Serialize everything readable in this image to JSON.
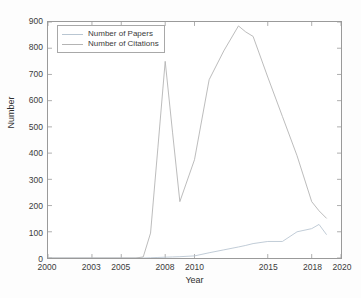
{
  "chart_data": {
    "type": "line",
    "title": "",
    "xlabel": "Year",
    "ylabel": "Number",
    "xlim": [
      2000,
      2020
    ],
    "ylim": [
      0,
      900
    ],
    "xticks": [
      2000,
      2003,
      2005,
      2008,
      2010,
      2015,
      2018,
      2020
    ],
    "xtick_labels": [
      "2000",
      "2003",
      "2005",
      "2008",
      "2010",
      "2015",
      "2018",
      "2020"
    ],
    "yticks": [
      0,
      100,
      200,
      300,
      400,
      500,
      600,
      700,
      800,
      900
    ],
    "ytick_labels": [
      "0",
      "100",
      "200",
      "300",
      "400",
      "500",
      "600",
      "700",
      "800",
      "900"
    ],
    "grid": false,
    "legend_position": "upper left",
    "x": [
      2000,
      2003,
      2005,
      2006,
      2006.5,
      2007,
      2007.5,
      2008,
      2008.5,
      2009,
      2010,
      2011,
      2012,
      2013,
      2013.5,
      2014,
      2015,
      2016,
      2017,
      2018,
      2018.5,
      2019
    ],
    "series": [
      {
        "name": "Number of Papers",
        "color": "#b9c6d2",
        "values": [
          0,
          0,
          0,
          0,
          0,
          1,
          2,
          3,
          4,
          5,
          8,
          20,
          31,
          42,
          48,
          55,
          63,
          63,
          100,
          112,
          128,
          90
        ]
      },
      {
        "name": "Number of Citations",
        "color": "#b4b4b4",
        "values": [
          0,
          0,
          0,
          0,
          4,
          95,
          420,
          750,
          480,
          215,
          375,
          680,
          790,
          885,
          862,
          845,
          690,
          540,
          390,
          215,
          180,
          152
        ]
      }
    ]
  },
  "legend": {
    "items": [
      {
        "label": "Number of Papers"
      },
      {
        "label": "Number of Citations"
      }
    ]
  }
}
